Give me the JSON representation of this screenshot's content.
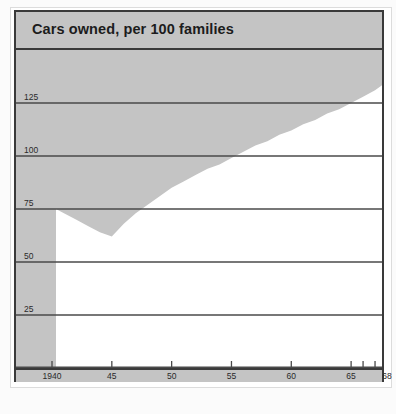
{
  "chart": {
    "title": "Cars owned, per 100 families",
    "frame_color": "#3a3a3a",
    "band_color": "#c4c4c4",
    "plot_bg": "#ffffff",
    "grid_color": "#4a4a4a"
  },
  "chart_data": {
    "type": "area",
    "title": "Cars owned, per 100 families",
    "xlabel": "",
    "ylabel": "",
    "xlim": [
      1940,
      1968
    ],
    "ylim": [
      0,
      150
    ],
    "grid": true,
    "legend": "none",
    "fill_direction": "above-curve",
    "y_ticks": [
      25,
      50,
      75,
      100,
      125
    ],
    "y_tick_labels": [
      "25",
      "50",
      "75",
      "100",
      "125"
    ],
    "x_ticks": [
      1940,
      1945,
      1950,
      1955,
      1960,
      1965,
      1966,
      1967,
      1968
    ],
    "x_tick_labels": [
      "1940",
      "45",
      "50",
      "55",
      "60",
      "65",
      "",
      "",
      "68"
    ],
    "x": [
      1940,
      1941,
      1942,
      1943,
      1944,
      1945,
      1946,
      1947,
      1948,
      1949,
      1950,
      1951,
      1952,
      1953,
      1954,
      1955,
      1956,
      1957,
      1958,
      1959,
      1960,
      1961,
      1962,
      1963,
      1964,
      1965,
      1966,
      1967,
      1968
    ],
    "values": [
      75,
      73,
      70,
      67,
      64,
      62,
      68,
      73,
      77,
      81,
      85,
      88,
      91,
      94,
      96,
      99,
      102,
      105,
      107,
      110,
      112,
      115,
      117,
      120,
      122,
      125,
      128,
      131,
      135
    ],
    "series": [
      {
        "name": "Cars owned per 100 families",
        "values": [
          75,
          73,
          70,
          67,
          64,
          62,
          68,
          73,
          77,
          81,
          85,
          88,
          91,
          94,
          96,
          99,
          102,
          105,
          107,
          110,
          112,
          115,
          117,
          120,
          122,
          125,
          128,
          131,
          135
        ]
      }
    ]
  }
}
